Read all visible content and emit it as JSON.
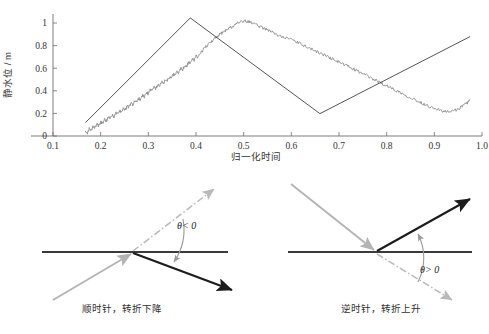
{
  "chart_data": {
    "type": "line",
    "title": "",
    "xlabel": "归一化时间",
    "ylabel": "静水位 / m",
    "xlim": [
      0.1,
      1.0
    ],
    "ylim": [
      0.0,
      1.08
    ],
    "grid": false,
    "legend": "none",
    "xticks": [
      "0.1",
      "0.2",
      "0.3",
      "0.4",
      "0.5",
      "0.6",
      "0.7",
      "0.8",
      "0.9",
      "1.0"
    ],
    "xtick_values": [
      0.1,
      0.2,
      0.3,
      0.4,
      0.5,
      0.6,
      0.7,
      0.8,
      0.9,
      1.0
    ],
    "yticks": [
      "0",
      "0.2",
      "0.4",
      "0.6",
      "0.8",
      "1"
    ],
    "ytick_values": [
      0,
      0.2,
      0.4,
      0.6,
      0.8,
      1.0
    ],
    "series": [
      {
        "name": "raw-signal",
        "color": "#8e8e8e",
        "style": "noisy-line",
        "x": [
          0.168,
          0.172,
          0.176,
          0.18,
          0.184,
          0.188,
          0.192,
          0.196,
          0.2,
          0.204,
          0.208,
          0.212,
          0.216,
          0.22,
          0.224,
          0.228,
          0.232,
          0.236,
          0.24,
          0.244,
          0.248,
          0.252,
          0.256,
          0.26,
          0.264,
          0.268,
          0.272,
          0.276,
          0.28,
          0.284,
          0.288,
          0.292,
          0.296,
          0.3,
          0.304,
          0.308,
          0.312,
          0.316,
          0.32,
          0.324,
          0.328,
          0.332,
          0.336,
          0.34,
          0.344,
          0.348,
          0.352,
          0.356,
          0.36,
          0.364,
          0.368,
          0.372,
          0.376,
          0.38,
          0.384,
          0.388,
          0.392,
          0.396,
          0.4,
          0.404,
          0.41,
          0.416,
          0.422,
          0.428,
          0.434,
          0.44,
          0.446,
          0.452,
          0.458,
          0.464,
          0.47,
          0.476,
          0.48,
          0.484,
          0.49,
          0.496,
          0.502,
          0.508,
          0.514,
          0.52,
          0.528,
          0.536,
          0.544,
          0.552,
          0.56,
          0.568,
          0.576,
          0.584,
          0.592,
          0.6,
          0.608,
          0.616,
          0.624,
          0.632,
          0.64,
          0.648,
          0.656,
          0.664,
          0.672,
          0.68,
          0.688,
          0.696,
          0.704,
          0.712,
          0.72,
          0.728,
          0.736,
          0.744,
          0.752,
          0.76,
          0.768,
          0.776,
          0.784,
          0.792,
          0.8,
          0.808,
          0.816,
          0.824,
          0.832,
          0.84,
          0.848,
          0.856,
          0.864,
          0.872,
          0.88,
          0.888,
          0.896,
          0.904,
          0.912,
          0.92,
          0.928,
          0.936,
          0.944,
          0.952,
          0.96,
          0.968,
          0.974
        ],
        "y": [
          0.05,
          0.028,
          0.062,
          0.04,
          0.085,
          0.068,
          0.105,
          0.09,
          0.125,
          0.112,
          0.148,
          0.135,
          0.165,
          0.152,
          0.185,
          0.172,
          0.205,
          0.195,
          0.225,
          0.212,
          0.245,
          0.232,
          0.268,
          0.255,
          0.29,
          0.278,
          0.312,
          0.3,
          0.335,
          0.322,
          0.36,
          0.348,
          0.385,
          0.372,
          0.41,
          0.398,
          0.432,
          0.42,
          0.455,
          0.442,
          0.478,
          0.468,
          0.5,
          0.492,
          0.522,
          0.515,
          0.545,
          0.538,
          0.572,
          0.562,
          0.598,
          0.588,
          0.625,
          0.615,
          0.652,
          0.645,
          0.68,
          0.672,
          0.705,
          0.7,
          0.74,
          0.768,
          0.795,
          0.818,
          0.845,
          0.868,
          0.888,
          0.905,
          0.922,
          0.938,
          0.955,
          0.968,
          0.978,
          0.99,
          1.002,
          1.012,
          1.018,
          1.012,
          1.005,
          0.998,
          0.985,
          0.962,
          0.948,
          0.935,
          0.918,
          0.9,
          0.885,
          0.88,
          0.865,
          0.852,
          0.838,
          0.822,
          0.805,
          0.79,
          0.772,
          0.758,
          0.742,
          0.728,
          0.71,
          0.695,
          0.678,
          0.662,
          0.648,
          0.63,
          0.615,
          0.598,
          0.58,
          0.565,
          0.548,
          0.53,
          0.512,
          0.495,
          0.478,
          0.462,
          0.445,
          0.428,
          0.412,
          0.395,
          0.378,
          0.362,
          0.345,
          0.328,
          0.312,
          0.295,
          0.28,
          0.265,
          0.252,
          0.24,
          0.228,
          0.218,
          0.212,
          0.218,
          0.228,
          0.245,
          0.265,
          0.29,
          0.318
        ]
      },
      {
        "name": "piecewise-linear-fit",
        "color": "#2a2a2a",
        "style": "straight-segments",
        "breakpoints_x": [
          0.168,
          0.388,
          0.66,
          0.975
        ],
        "breakpoints_y": [
          0.118,
          1.045,
          0.198,
          0.88
        ]
      }
    ]
  },
  "chart": {
    "ylabel": "静水位 / m",
    "xlabel": "归一化时间",
    "xticks": [
      "0.1",
      "0.2",
      "0.3",
      "0.4",
      "0.5",
      "0.6",
      "0.7",
      "0.8",
      "0.9",
      "1.0"
    ],
    "yticks": [
      "0",
      "0.2",
      "0.4",
      "0.6",
      "0.8",
      "1"
    ]
  },
  "diagrams": [
    {
      "id": "clockwise",
      "theta_label": "θ< 0",
      "caption": "顺时针，转折下降",
      "incoming_ray": "up-right gray arrow arriving at vertex",
      "outgoing_ray": "down-right black arrow leaving vertex",
      "ghost_ray": "dash-dot gray continuation up-right",
      "turn_direction": "clockwise"
    },
    {
      "id": "counterclockwise",
      "theta_label": "θ> 0",
      "caption": "逆时针，转折上升",
      "incoming_ray": "down-right gray arrow arriving at vertex",
      "outgoing_ray": "up-right black arrow leaving vertex",
      "ghost_ray": "dash-dot gray continuation down-right",
      "turn_direction": "counterclockwise"
    }
  ],
  "colors": {
    "raw_signal": "#8e8e8e",
    "fit_line": "#2a2a2a",
    "axis": "#6d6d6d",
    "baseline": "#3a3a3a",
    "ray_in": "#b4b4b4",
    "ray_out": "#1c1c1c",
    "ghost": "#b9b9b9",
    "background": "#ffffff"
  }
}
